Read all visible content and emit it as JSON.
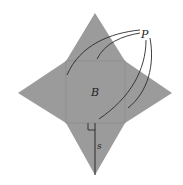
{
  "diagram": {
    "type": "pyramid-net",
    "labels": {
      "lateral_faces": "P",
      "base": "B",
      "slant_height": "s"
    },
    "colors": {
      "fill": "#9b9b9b",
      "base_outline": "#8e8e8e",
      "stroke": "#2a2a2a",
      "background": "#ffffff"
    }
  }
}
